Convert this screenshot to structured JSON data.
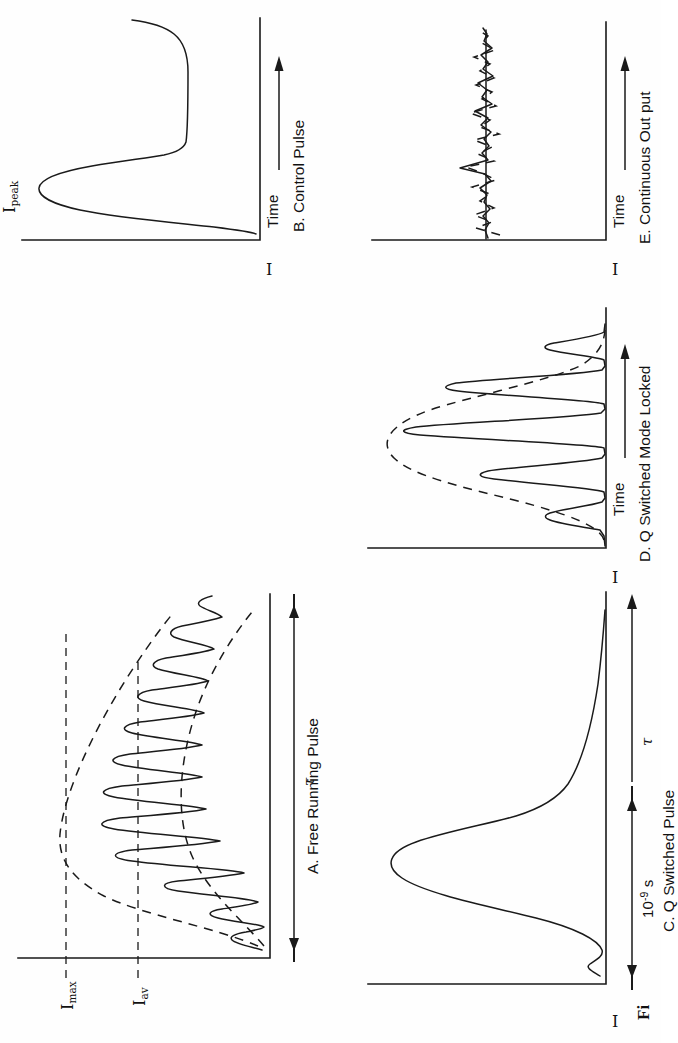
{
  "figure": {
    "caption_fragment": "Fi",
    "orientation": "rotated-90-ccw",
    "panel_count": 5
  },
  "axis_labels": {
    "intensity": "I",
    "time": "Time"
  },
  "panels": [
    {
      "id": "A",
      "caption": "A.  Free Running Pulse",
      "y_axis": "I",
      "markers": [
        "I",
        "max",
        "av"
      ],
      "level_labels": [
        {
          "text": "I",
          "sub": "max"
        },
        {
          "text": "I",
          "sub": "av"
        }
      ],
      "duration_label": "τ",
      "description": "Free running pulse: irregular relaxation-oscillation spiking under a dashed triangular/decaying envelope, with Imax and Iav reference levels and total duration tau."
    },
    {
      "id": "B",
      "caption": "B.  Control Pulse",
      "y_axis": "I",
      "x_axis": "Time",
      "peak_label": {
        "text": "I",
        "sub": "peak"
      },
      "description": "Control pulse: single smooth peak rising to I-peak then falling to a sustained plateau level."
    },
    {
      "id": "C",
      "caption": "C.  Q Switched Pulse",
      "y_axis": "I",
      "scale_label": {
        "mantissa": "10",
        "exponent": "-9",
        "unit": "s"
      },
      "duration_label": "τ",
      "description": "Q switched pulse: single tall narrow giant pulse of about 10^-9 s duration with a long tail."
    },
    {
      "id": "D",
      "caption": "D.  Q Switched Mode Locked",
      "y_axis": "I",
      "x_axis": "Time",
      "description": "Q switched mode locked: train of four to five sharp ultrashort spikes beneath a dashed Gaussian envelope."
    },
    {
      "id": "E",
      "caption": "E.  Continuous Out put",
      "y_axis": "I",
      "x_axis": "Time",
      "description": "Continuous output: nearly constant level with small random noise fluctuations about the mean, shown as solid line with dashed fluctuation trace."
    }
  ],
  "colors": {
    "ink": "#1a1a1a",
    "background": "#fefefe"
  }
}
